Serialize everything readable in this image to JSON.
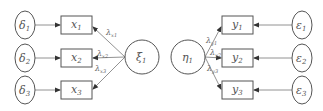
{
  "diagram": {
    "type": "structural-equation-model",
    "exogenous": {
      "errors": [
        {
          "symbol": "δ",
          "sub": "1"
        },
        {
          "symbol": "δ",
          "sub": "2"
        },
        {
          "symbol": "δ",
          "sub": "3"
        }
      ],
      "indicators": [
        {
          "symbol": "x",
          "sub": "1"
        },
        {
          "symbol": "x",
          "sub": "2"
        },
        {
          "symbol": "x",
          "sub": "3"
        }
      ],
      "loadings": [
        {
          "symbol": "λ",
          "sub": "x1"
        },
        {
          "symbol": "λ",
          "sub": "x2"
        },
        {
          "symbol": "λ",
          "sub": "x3"
        }
      ],
      "latent": {
        "symbol": "ξ",
        "sub": "1"
      }
    },
    "endogenous": {
      "latent": {
        "symbol": "η",
        "sub": "1"
      },
      "loadings": [
        {
          "symbol": "λ",
          "sub": "y1"
        },
        {
          "symbol": "λ",
          "sub": "y2"
        },
        {
          "symbol": "λ",
          "sub": "y3"
        }
      ],
      "indicators": [
        {
          "symbol": "y",
          "sub": "1"
        },
        {
          "symbol": "y",
          "sub": "2"
        },
        {
          "symbol": "y",
          "sub": "3"
        }
      ],
      "errors": [
        {
          "symbol": "ε",
          "sub": "1"
        },
        {
          "symbol": "ε",
          "sub": "2"
        },
        {
          "symbol": "ε",
          "sub": "3"
        }
      ]
    }
  }
}
